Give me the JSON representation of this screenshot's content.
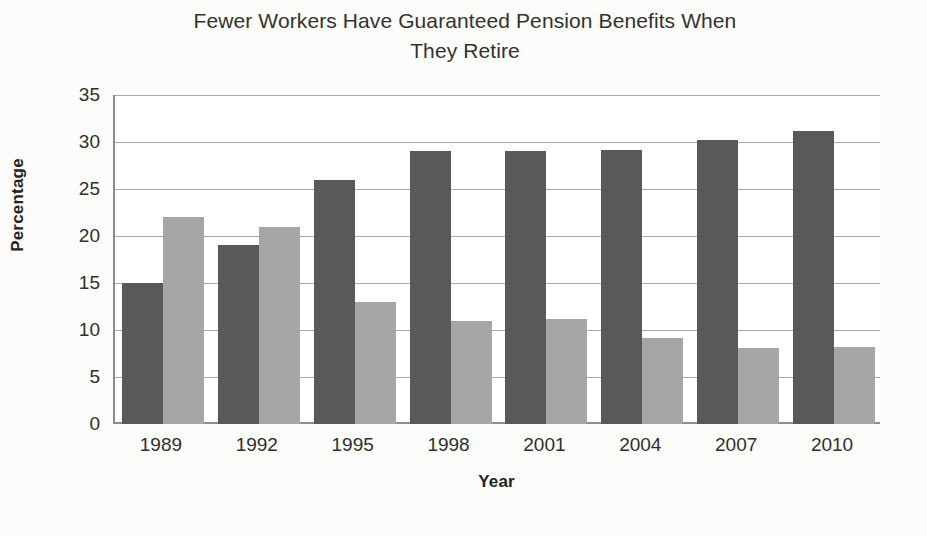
{
  "chart_data": {
    "type": "bar",
    "title": "Fewer Workers Have Guaranteed Pension Benefits When They Retire",
    "title_line1": "Fewer Workers Have Guaranteed Pension Benefits When",
    "title_line2": "They Retire",
    "xlabel": "Year",
    "ylabel": "Percentage",
    "categories": [
      "1989",
      "1992",
      "1995",
      "1998",
      "2001",
      "2004",
      "2007",
      "2010"
    ],
    "series": [
      {
        "name": "series-1",
        "color": "#595959",
        "values": [
          15,
          19,
          26,
          29,
          29,
          29.2,
          30.2,
          31.2
        ]
      },
      {
        "name": "series-2",
        "color": "#a6a6a6",
        "values": [
          22,
          21,
          13,
          11,
          11.2,
          9.2,
          8.1,
          8.2
        ]
      }
    ],
    "ylim": [
      0,
      35
    ],
    "ytick_step": 5,
    "yticks": [
      "35",
      "30",
      "25",
      "20",
      "15",
      "10",
      "5",
      "0"
    ],
    "ytick_values": [
      35,
      30,
      25,
      20,
      15,
      10,
      5,
      0
    ],
    "grid": true,
    "legend": "none",
    "legend_position": "none",
    "background_color": "#fcfcfb",
    "plot_background_color": "#ffffff",
    "axis_color": "#8d8d8d",
    "gridline_color": "#a9a9a9"
  }
}
